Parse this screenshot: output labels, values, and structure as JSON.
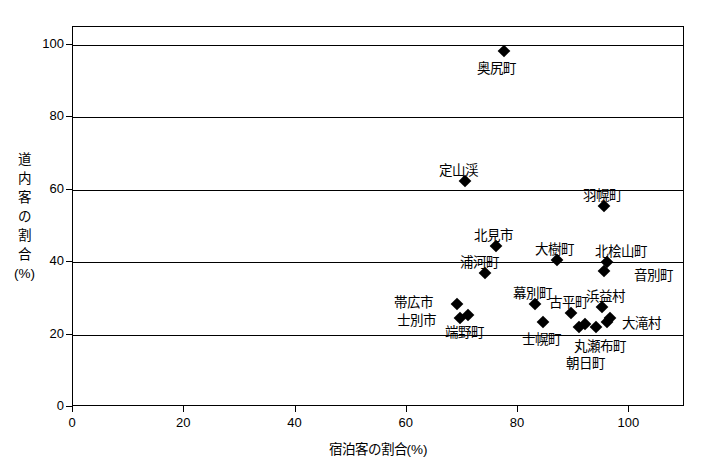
{
  "chart_data": {
    "type": "scatter",
    "title": "",
    "xlabel": "宿泊客の割合(%)",
    "ylabel": "道内客の割合(%)",
    "ylabel_lines": [
      "道",
      "内",
      "客",
      "の",
      "割",
      "合",
      "(%)"
    ],
    "xlim": [
      0,
      110
    ],
    "ylim": [
      0,
      105
    ],
    "xticks": [
      0,
      20,
      40,
      60,
      80,
      100
    ],
    "yticks": [
      0,
      20,
      40,
      60,
      80,
      100
    ],
    "xtick_labels": [
      "0",
      "20",
      "40",
      "60",
      "80",
      "100"
    ],
    "ytick_labels": [
      "0",
      "20",
      "40",
      "60",
      "80",
      "100"
    ],
    "grid": "horizontal",
    "legend": "none",
    "points": [
      {
        "label": "奥尻町",
        "x": 77.5,
        "y": 98.5,
        "label_dx": -8,
        "label_dy": 17,
        "anchor": "center"
      },
      {
        "label": "定山渓",
        "x": 70.5,
        "y": 62.5,
        "label_dx": -7,
        "label_dy": -11,
        "anchor": "center"
      },
      {
        "label": "羽幌町",
        "x": 95.5,
        "y": 55.5,
        "label_dx": -2,
        "label_dy": -11,
        "anchor": "center"
      },
      {
        "label": "北見市",
        "x": 76.0,
        "y": 44.5,
        "label_dx": -2,
        "label_dy": -11,
        "anchor": "center"
      },
      {
        "label": "大樹町",
        "x": 87.0,
        "y": 40.5,
        "label_dx": -3,
        "label_dy": -11,
        "anchor": "center"
      },
      {
        "label": "北桧山町",
        "x": 96.0,
        "y": 40.0,
        "label_dx": 14,
        "label_dy": -11,
        "anchor": "center"
      },
      {
        "label": "音別町",
        "x": 95.5,
        "y": 37.5,
        "label_dx": 30,
        "label_dy": 4,
        "anchor": "left"
      },
      {
        "label": "浦河町",
        "x": 74.0,
        "y": 37.0,
        "label_dx": -5,
        "label_dy": -11,
        "anchor": "center"
      },
      {
        "label": "幕別町",
        "x": 83.0,
        "y": 28.5,
        "label_dx": -2,
        "label_dy": -11,
        "anchor": "center"
      },
      {
        "label": "帯広市",
        "x": 69.0,
        "y": 28.5,
        "label_dx": -24,
        "label_dy": -2,
        "anchor": "right"
      },
      {
        "label": "浜益村",
        "x": 95.0,
        "y": 27.5,
        "label_dx": 4,
        "label_dy": -11,
        "anchor": "center"
      },
      {
        "label": "古平町",
        "x": 89.5,
        "y": 26.0,
        "label_dx": -2,
        "label_dy": -11,
        "anchor": "center"
      },
      {
        "label": "端野町",
        "x": 71.0,
        "y": 25.5,
        "label_dx": -4,
        "label_dy": 17,
        "anchor": "center"
      },
      {
        "label": "士別市",
        "x": 69.5,
        "y": 24.5,
        "label_dx": -24,
        "label_dy": 2,
        "anchor": "right"
      },
      {
        "label": "大滝村",
        "x": 96.5,
        "y": 24.5,
        "label_dx": 12,
        "label_dy": 5,
        "anchor": "left"
      },
      {
        "label": "士幌町",
        "x": 84.5,
        "y": 23.5,
        "label_dx": -2,
        "label_dy": 17,
        "anchor": "center"
      },
      {
        "label": "丸瀬布町",
        "x": 94.0,
        "y": 22.0,
        "label_dx": 4,
        "label_dy": 19,
        "anchor": "center"
      },
      {
        "label": "朝日町",
        "x": 91.0,
        "y": 22.0,
        "label_dx": 6,
        "label_dy": 36,
        "anchor": "center"
      }
    ],
    "extra_markers": [
      {
        "x": 92.0,
        "y": 23.0
      },
      {
        "x": 96.0,
        "y": 23.5
      }
    ]
  }
}
